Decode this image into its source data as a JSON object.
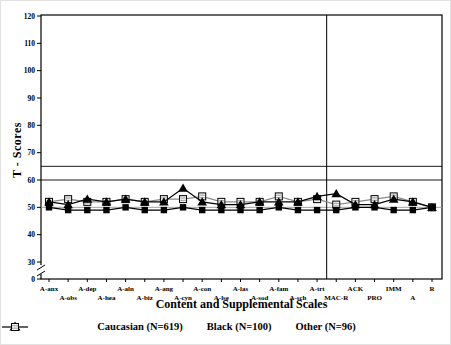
{
  "figure": {
    "background": "#ffffff"
  },
  "chart_data": {
    "type": "line",
    "title": "",
    "xlabel": "Content and Supplemental Scales",
    "ylabel": "T - Scores",
    "categories": [
      "A-anx",
      "A-obs",
      "A-dep",
      "A-hea",
      "A-aln",
      "A-biz",
      "A-ang",
      "A-cyn",
      "A-con",
      "A-lse",
      "A-las",
      "A-sod",
      "A-fam",
      "A-sch",
      "A-trt",
      "MAC-R",
      "ACK",
      "PRO",
      "IMM",
      "A",
      "R"
    ],
    "series": [
      {
        "name": "Caucasian (N=619)",
        "marker": "filled-square",
        "line_color": "#000000",
        "values": [
          50,
          49,
          49,
          49,
          50,
          49,
          49,
          50,
          49,
          49,
          49,
          49,
          50,
          49,
          49,
          49,
          50,
          50,
          49,
          49,
          50
        ]
      },
      {
        "name": "Black (N=100)",
        "marker": "filled-triangle",
        "line_color": "#000000",
        "values": [
          52,
          51,
          53,
          52,
          53,
          52,
          52,
          57,
          52,
          51,
          51,
          52,
          52,
          52,
          54,
          55,
          51,
          51,
          53,
          52,
          50
        ]
      },
      {
        "name": "Other (N=96)",
        "marker": "hatched-open-square",
        "line_color": "#8a8a8a",
        "values": [
          52,
          53,
          52,
          52,
          53,
          52,
          53,
          53,
          54,
          52,
          52,
          52,
          54,
          52,
          53,
          51,
          52,
          53,
          54,
          52,
          50
        ]
      }
    ],
    "y_ticks": [
      0,
      30,
      40,
      50,
      60,
      70,
      80,
      90,
      100,
      110,
      120
    ],
    "ylim": [
      0,
      120
    ],
    "axis_break_between": [
      0,
      30
    ],
    "reference_lines": [
      {
        "value": 65,
        "color": "#000000"
      },
      {
        "value": 60,
        "color": "#000000"
      },
      {
        "value": 50,
        "color": "#999999"
      }
    ],
    "separator_after_category": "A-trt",
    "grid": false,
    "legend_position": "bottom"
  }
}
